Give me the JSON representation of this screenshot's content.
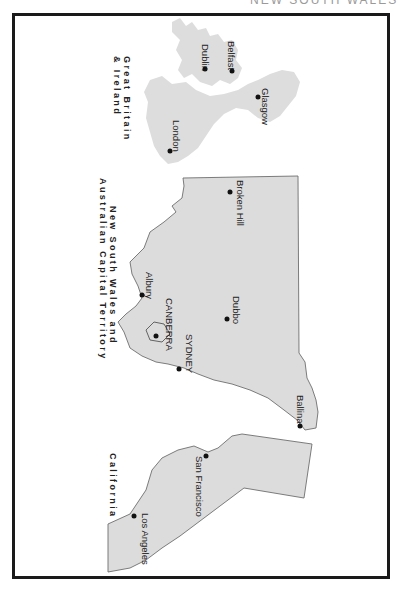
{
  "header": {
    "title": "NEW SOUTH WALES"
  },
  "regions": [
    {
      "id": "gb-ireland",
      "label_line1": "Great Britain",
      "label_line2": "& Ireland"
    },
    {
      "id": "nsw-act",
      "label_line1": "New South Wales and",
      "label_line2": "Australian Capital Territory"
    },
    {
      "id": "california",
      "label_line1": "California"
    }
  ],
  "cities": [
    {
      "name": "Belfast",
      "region": "gb-ireland"
    },
    {
      "name": "Dublin",
      "region": "gb-ireland"
    },
    {
      "name": "Glasgow",
      "region": "gb-ireland"
    },
    {
      "name": "London",
      "region": "gb-ireland"
    },
    {
      "name": "Broken Hill",
      "region": "nsw-act"
    },
    {
      "name": "Dubbo",
      "region": "nsw-act"
    },
    {
      "name": "Albury",
      "region": "nsw-act"
    },
    {
      "name": "CANBERRA",
      "region": "nsw-act"
    },
    {
      "name": "SYDNEY",
      "region": "nsw-act"
    },
    {
      "name": "Ballina",
      "region": "nsw-act"
    },
    {
      "name": "San Francisco",
      "region": "california"
    },
    {
      "name": "Los Angeles",
      "region": "california"
    }
  ],
  "colors": {
    "land": "#dcdcdc",
    "border": "#1a1a1a",
    "dot": "#111111"
  }
}
